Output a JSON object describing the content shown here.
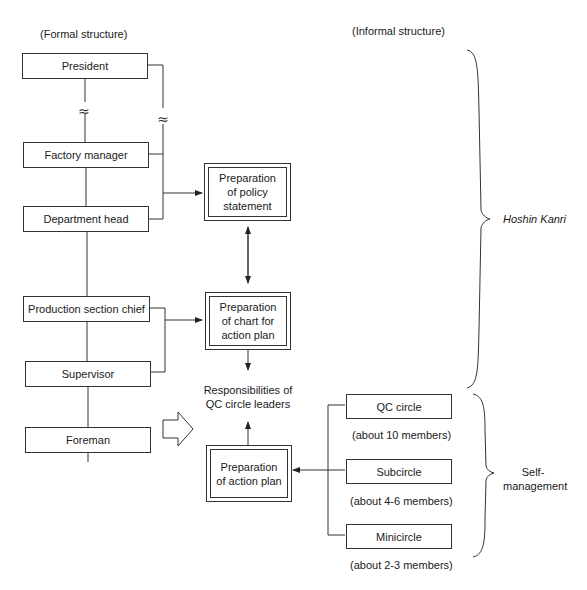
{
  "headers": {
    "formal": "(Formal structure)",
    "informal": "(Informal structure)"
  },
  "formal_roles": [
    "President",
    "Factory manager",
    "Department head",
    "Production section chief",
    "Supervisor",
    "Foreman"
  ],
  "process_boxes": {
    "policy": "Preparation of policy statement",
    "chart": "Preparation of chart for action plan",
    "action": "Preparation of action plan"
  },
  "responsibilities_label": "Responsibilities of QC circle leaders",
  "circles": [
    {
      "name": "QC circle",
      "size": "(about 10 members)"
    },
    {
      "name": "Subcircle",
      "size": "(about 4-6 members)"
    },
    {
      "name": "Minicircle",
      "size": "(about 2-3 members)"
    }
  ],
  "braces": {
    "top": "Hoshin Kanri",
    "bottom": "Self-management"
  },
  "line_color": "#333333"
}
